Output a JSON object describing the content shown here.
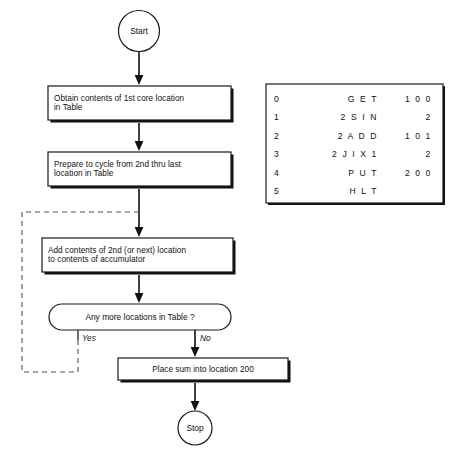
{
  "diagram": {
    "terminals": {
      "start": "Start",
      "stop": "Stop"
    },
    "process_boxes": [
      {
        "id": "obtain",
        "line1": "Obtain contents of 1st core location",
        "line2": "in Table"
      },
      {
        "id": "prepare",
        "line1": "Prepare to cycle from 2nd thru last",
        "line2": "location in Table"
      },
      {
        "id": "add",
        "line1": "Add contents of 2nd (or next) location",
        "line2": "to contents of accumulator"
      },
      {
        "id": "place",
        "line1": "Place sum into location 200",
        "line2": ""
      }
    ],
    "decision": {
      "text": "Any more locations in Table ?",
      "yes_label": "Yes",
      "no_label": "No"
    },
    "colors": {
      "line": "#111111",
      "dashed_loop": "#555555",
      "fill": "#ffffff"
    }
  },
  "code_listing": {
    "columns": [
      "line",
      "operation",
      "operand"
    ],
    "rows": [
      {
        "line": "0",
        "operation": "G E T",
        "operand": "1 0 0"
      },
      {
        "line": "1",
        "operation": "2 S I N",
        "operand": "2"
      },
      {
        "line": "2",
        "operation": "2 A D D",
        "operand": "1 0 1"
      },
      {
        "line": "3",
        "operation": "2 J I X 1",
        "operand": "2"
      },
      {
        "line": "4",
        "operation": "P U T",
        "operand": "2 0 0"
      },
      {
        "line": "5",
        "operation": "H L T",
        "operand": ""
      }
    ]
  }
}
